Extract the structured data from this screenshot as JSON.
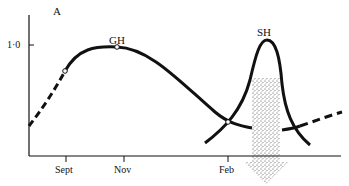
{
  "panel_label": "A",
  "y_tick": "1·0",
  "x_ticks": [
    "Sept",
    "Nov",
    "Feb"
  ],
  "curves": [
    {
      "name": "GH",
      "label": "GH"
    },
    {
      "name": "SH",
      "label": "SH"
    }
  ],
  "colors": {
    "line": "#111111",
    "stipple": "#555555",
    "background": "#ffffff"
  }
}
